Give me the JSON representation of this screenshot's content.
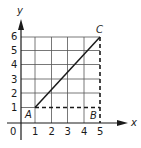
{
  "diagram": {
    "axes": {
      "x_label": "x",
      "y_label": "y",
      "origin_label": "0",
      "x_ticks": [
        "1",
        "2",
        "3",
        "4",
        "5"
      ],
      "y_ticks": [
        "1",
        "2",
        "3",
        "4",
        "5",
        "6"
      ]
    },
    "grid": {
      "x_range": [
        0,
        5
      ],
      "y_range": [
        0,
        6
      ],
      "color": "#555555"
    },
    "points": [
      {
        "label": "A",
        "x": 1,
        "y": 1
      },
      {
        "label": "B",
        "x": 5,
        "y": 1
      },
      {
        "label": "C",
        "x": 5,
        "y": 6
      }
    ],
    "segments": [
      {
        "from": "A",
        "to": "C",
        "style": "solid"
      },
      {
        "from": "A",
        "to": "B",
        "style": "dashed"
      },
      {
        "from": "B",
        "to": "C",
        "style": "dashed"
      }
    ],
    "line_color": "#1a1a1a"
  }
}
